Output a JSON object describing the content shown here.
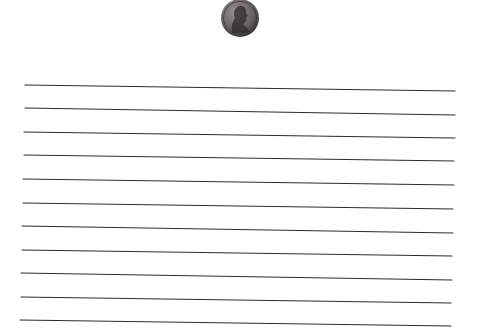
{
  "coin": {
    "icon": "penny-icon",
    "cx": 240,
    "cy": 18,
    "r": 19,
    "colors": {
      "rim": "#3a3634",
      "face": "#6b6462",
      "highlight": "#9a9390",
      "portrait": "#2e2a29"
    }
  },
  "lines": {
    "color": "#2b2b2b",
    "stroke_width": 1.2,
    "items": [
      {
        "x1": 25,
        "y1": 85,
        "x2": 455,
        "y2": 91
      },
      {
        "x1": 25,
        "y1": 108,
        "x2": 455,
        "y2": 115
      },
      {
        "x1": 24,
        "y1": 132,
        "x2": 455,
        "y2": 138
      },
      {
        "x1": 24,
        "y1": 155,
        "x2": 454,
        "y2": 161
      },
      {
        "x1": 23,
        "y1": 179,
        "x2": 454,
        "y2": 185
      },
      {
        "x1": 23,
        "y1": 203,
        "x2": 453,
        "y2": 209
      },
      {
        "x1": 22,
        "y1": 226,
        "x2": 453,
        "y2": 233
      },
      {
        "x1": 22,
        "y1": 250,
        "x2": 452,
        "y2": 256
      },
      {
        "x1": 21,
        "y1": 273,
        "x2": 452,
        "y2": 280
      },
      {
        "x1": 21,
        "y1": 297,
        "x2": 451,
        "y2": 303
      },
      {
        "x1": 20,
        "y1": 320,
        "x2": 451,
        "y2": 326
      }
    ]
  }
}
